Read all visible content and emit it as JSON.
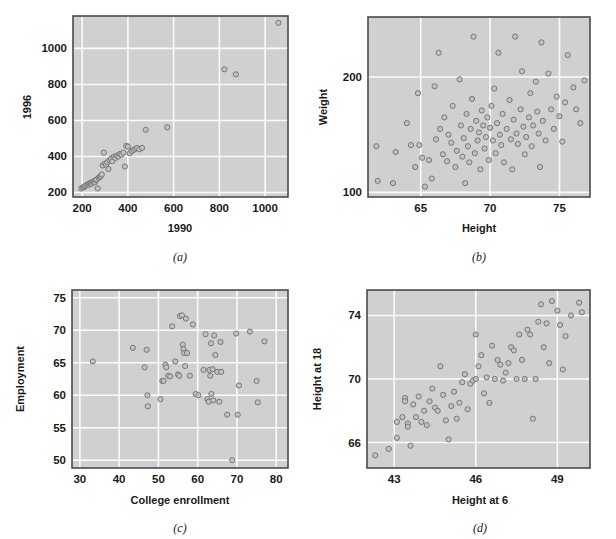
{
  "figure": {
    "background_color": "#ffffff",
    "panel_background_color": "#d0d0d0",
    "gridline_color": "#fbfbfb",
    "frame_color": "#4a4a4a",
    "marker_fill": "#c2c2c2",
    "marker_stroke": "#6e6e6e",
    "panel_count": 4
  },
  "captions": {
    "a": "(a)",
    "b": "(b)",
    "c": "(c)",
    "d": "(d)"
  },
  "chart_data": [
    {
      "id": "a",
      "type": "scatter",
      "title": "",
      "caption": "(a)",
      "xlabel": "1990",
      "ylabel": "1996",
      "xticks": [
        200,
        400,
        600,
        800,
        1000
      ],
      "yticks": [
        200,
        400,
        600,
        800,
        1000
      ],
      "xticklabels": [
        "200",
        "400",
        "600",
        "800",
        "1000"
      ],
      "yticklabels": [
        "200",
        "400",
        "600",
        "800",
        "1000"
      ],
      "xlim": [
        160,
        1100
      ],
      "ylim": [
        175,
        1180
      ],
      "grid": true,
      "legend": false,
      "points": [
        [
          196,
          222
        ],
        [
          203,
          228
        ],
        [
          209,
          231
        ],
        [
          213,
          236
        ],
        [
          218,
          240
        ],
        [
          224,
          245
        ],
        [
          229,
          243
        ],
        [
          233,
          251
        ],
        [
          238,
          254
        ],
        [
          241,
          249
        ],
        [
          246,
          258
        ],
        [
          250,
          262
        ],
        [
          255,
          256
        ],
        [
          259,
          268
        ],
        [
          263,
          272
        ],
        [
          268,
          223
        ],
        [
          272,
          281
        ],
        [
          277,
          287
        ],
        [
          281,
          292
        ],
        [
          286,
          300
        ],
        [
          290,
          350
        ],
        [
          295,
          421
        ],
        [
          300,
          360
        ],
        [
          305,
          355
        ],
        [
          310,
          368
        ],
        [
          315,
          330
        ],
        [
          320,
          378
        ],
        [
          326,
          388
        ],
        [
          332,
          374
        ],
        [
          338,
          398
        ],
        [
          345,
          392
        ],
        [
          352,
          405
        ],
        [
          358,
          400
        ],
        [
          365,
          414
        ],
        [
          372,
          410
        ],
        [
          380,
          422
        ],
        [
          387,
          344
        ],
        [
          393,
          460
        ],
        [
          400,
          455
        ],
        [
          408,
          418
        ],
        [
          416,
          430
        ],
        [
          424,
          436
        ],
        [
          432,
          442
        ],
        [
          440,
          447
        ],
        [
          450,
          440
        ],
        [
          462,
          448
        ],
        [
          478,
          548
        ],
        [
          572,
          562
        ],
        [
          822,
          884
        ],
        [
          872,
          856
        ],
        [
          1058,
          1142
        ]
      ]
    },
    {
      "id": "b",
      "type": "scatter",
      "title": "",
      "caption": "(b)",
      "xlabel": "Height",
      "ylabel": "Weight",
      "xticks": [
        65,
        70,
        75
      ],
      "yticks": [
        100,
        200
      ],
      "xticklabels": [
        "65",
        "70",
        "75"
      ],
      "yticklabels": [
        "100",
        "200"
      ],
      "xlim": [
        61.2,
        77.2
      ],
      "ylim": [
        96,
        252
      ],
      "grid": true,
      "legend": false,
      "points": [
        [
          61.8,
          140
        ],
        [
          61.9,
          110
        ],
        [
          63.0,
          108
        ],
        [
          63.2,
          135
        ],
        [
          64.0,
          160
        ],
        [
          64.3,
          141
        ],
        [
          64.6,
          122
        ],
        [
          64.8,
          186
        ],
        [
          64.9,
          141
        ],
        [
          65.1,
          130
        ],
        [
          65.3,
          105
        ],
        [
          65.6,
          128
        ],
        [
          65.8,
          112
        ],
        [
          66.0,
          192
        ],
        [
          66.1,
          146
        ],
        [
          66.3,
          221
        ],
        [
          66.4,
          155
        ],
        [
          66.6,
          133
        ],
        [
          66.7,
          165
        ],
        [
          66.9,
          127
        ],
        [
          67.0,
          150
        ],
        [
          67.2,
          143
        ],
        [
          67.3,
          175
        ],
        [
          67.5,
          122
        ],
        [
          67.6,
          136
        ],
        [
          67.8,
          198
        ],
        [
          67.9,
          158
        ],
        [
          68.0,
          131
        ],
        [
          68.1,
          147
        ],
        [
          68.2,
          108
        ],
        [
          68.3,
          168
        ],
        [
          68.4,
          140
        ],
        [
          68.5,
          126
        ],
        [
          68.6,
          155
        ],
        [
          68.7,
          181
        ],
        [
          68.8,
          235
        ],
        [
          68.9,
          134
        ],
        [
          69.0,
          162
        ],
        [
          69.1,
          145
        ],
        [
          69.2,
          152
        ],
        [
          69.3,
          120
        ],
        [
          69.4,
          171
        ],
        [
          69.5,
          158
        ],
        [
          69.6,
          138
        ],
        [
          69.7,
          148
        ],
        [
          69.8,
          165
        ],
        [
          69.9,
          128
        ],
        [
          70.0,
          156
        ],
        [
          70.1,
          175
        ],
        [
          70.2,
          145
        ],
        [
          70.3,
          190
        ],
        [
          70.4,
          134
        ],
        [
          70.5,
          160
        ],
        [
          70.6,
          221
        ],
        [
          70.7,
          150
        ],
        [
          70.8,
          141
        ],
        [
          70.9,
          168
        ],
        [
          71.0,
          126
        ],
        [
          71.2,
          155
        ],
        [
          71.4,
          180
        ],
        [
          71.5,
          146
        ],
        [
          71.6,
          120
        ],
        [
          71.7,
          163
        ],
        [
          71.8,
          235
        ],
        [
          71.9,
          151
        ],
        [
          72.0,
          142
        ],
        [
          72.2,
          172
        ],
        [
          72.3,
          205
        ],
        [
          72.4,
          157
        ],
        [
          72.5,
          133
        ],
        [
          72.6,
          148
        ],
        [
          72.8,
          165
        ],
        [
          72.9,
          186
        ],
        [
          73.0,
          140
        ],
        [
          73.1,
          158
        ],
        [
          73.3,
          196
        ],
        [
          73.4,
          170
        ],
        [
          73.5,
          151
        ],
        [
          73.6,
          122
        ],
        [
          73.7,
          230
        ],
        [
          73.8,
          162
        ],
        [
          74.0,
          145
        ],
        [
          74.2,
          203
        ],
        [
          74.4,
          172
        ],
        [
          74.6,
          155
        ],
        [
          74.8,
          183
        ],
        [
          75.0,
          166
        ],
        [
          75.2,
          144
        ],
        [
          75.4,
          178
        ],
        [
          75.6,
          219
        ],
        [
          76.0,
          191
        ],
        [
          76.2,
          172
        ],
        [
          76.5,
          160
        ],
        [
          76.8,
          197
        ]
      ]
    },
    {
      "id": "c",
      "type": "scatter",
      "title": "",
      "caption": "(c)",
      "xlabel": "College enrollment",
      "ylabel": "Employment",
      "xticks": [
        30,
        40,
        50,
        60,
        70,
        80
      ],
      "yticks": [
        50,
        55,
        60,
        65,
        70,
        75
      ],
      "xticklabels": [
        "30",
        "40",
        "50",
        "60",
        "70",
        "80"
      ],
      "yticklabels": [
        "50",
        "55",
        "60",
        "65",
        "70",
        "75"
      ],
      "xlim": [
        28,
        83
      ],
      "ylim": [
        48.8,
        76.2
      ],
      "grid": true,
      "legend": false,
      "points": [
        [
          33.3,
          65.2
        ],
        [
          43.5,
          67.3
        ],
        [
          46.5,
          64.3
        ],
        [
          47.0,
          67.0
        ],
        [
          47.2,
          60.0
        ],
        [
          47.3,
          58.3
        ],
        [
          50.5,
          59.4
        ],
        [
          51.0,
          62.2
        ],
        [
          51.3,
          62.2
        ],
        [
          51.8,
          64.7
        ],
        [
          52.0,
          64.3
        ],
        [
          52.5,
          63.0
        ],
        [
          53.0,
          62.9
        ],
        [
          53.5,
          70.6
        ],
        [
          54.3,
          65.2
        ],
        [
          55.0,
          63.2
        ],
        [
          55.3,
          63.0
        ],
        [
          55.5,
          72.2
        ],
        [
          56.0,
          72.3
        ],
        [
          56.2,
          67.8
        ],
        [
          56.4,
          67.1
        ],
        [
          56.6,
          66.5
        ],
        [
          56.8,
          64.5
        ],
        [
          57.0,
          71.8
        ],
        [
          57.3,
          66.5
        ],
        [
          58.0,
          63.0
        ],
        [
          58.8,
          70.9
        ],
        [
          59.5,
          60.2
        ],
        [
          60.2,
          60.0
        ],
        [
          61.5,
          63.9
        ],
        [
          62.0,
          69.4
        ],
        [
          62.5,
          59.4
        ],
        [
          62.8,
          59.0
        ],
        [
          63.0,
          63.9
        ],
        [
          63.2,
          63.0
        ],
        [
          63.4,
          68.0
        ],
        [
          63.5,
          60.2
        ],
        [
          63.8,
          64.0
        ],
        [
          64.0,
          59.2
        ],
        [
          64.2,
          69.2
        ],
        [
          64.5,
          66.2
        ],
        [
          65.0,
          63.6
        ],
        [
          65.5,
          59.0
        ],
        [
          65.8,
          68.2
        ],
        [
          66.0,
          63.6
        ],
        [
          67.5,
          57.0
        ],
        [
          68.8,
          50.0
        ],
        [
          69.8,
          69.5
        ],
        [
          70.2,
          57.0
        ],
        [
          70.5,
          61.5
        ],
        [
          73.3,
          69.8
        ],
        [
          75.0,
          62.2
        ],
        [
          75.3,
          58.9
        ],
        [
          77.0,
          68.3
        ]
      ]
    },
    {
      "id": "d",
      "type": "scatter",
      "title": "",
      "caption": "(d)",
      "xlabel": "Height at 6",
      "ylabel": "Height at 18",
      "ylabel_rendered": "Height at 18",
      "xticks": [
        43,
        46,
        49
      ],
      "yticks": [
        66,
        70,
        74
      ],
      "xticklabels": [
        "43",
        "46",
        "49"
      ],
      "yticklabels": [
        "66",
        "70",
        "74"
      ],
      "xlim": [
        42.0,
        50.2
      ],
      "ylim": [
        64.4,
        75.6
      ],
      "grid": true,
      "legend": false,
      "points": [
        [
          42.3,
          65.2
        ],
        [
          42.8,
          65.6
        ],
        [
          43.1,
          66.3
        ],
        [
          43.1,
          67.3
        ],
        [
          43.3,
          67.6
        ],
        [
          43.4,
          68.8
        ],
        [
          43.4,
          68.6
        ],
        [
          43.5,
          67.2
        ],
        [
          43.5,
          67.0
        ],
        [
          43.6,
          65.8
        ],
        [
          43.7,
          68.4
        ],
        [
          43.8,
          67.6
        ],
        [
          43.9,
          68.9
        ],
        [
          44.0,
          67.3
        ],
        [
          44.1,
          68.0
        ],
        [
          44.2,
          67.1
        ],
        [
          44.3,
          68.6
        ],
        [
          44.4,
          69.4
        ],
        [
          44.5,
          68.2
        ],
        [
          44.6,
          68.0
        ],
        [
          44.7,
          70.8
        ],
        [
          44.8,
          69.0
        ],
        [
          44.9,
          67.4
        ],
        [
          45.0,
          66.2
        ],
        [
          45.1,
          68.3
        ],
        [
          45.2,
          69.2
        ],
        [
          45.3,
          67.5
        ],
        [
          45.4,
          68.5
        ],
        [
          45.5,
          69.8
        ],
        [
          45.6,
          70.3
        ],
        [
          45.7,
          68.1
        ],
        [
          45.8,
          69.7
        ],
        [
          45.9,
          69.9
        ],
        [
          46.0,
          72.8
        ],
        [
          46.0,
          70.0
        ],
        [
          46.1,
          70.8
        ],
        [
          46.2,
          71.5
        ],
        [
          46.3,
          69.1
        ],
        [
          46.4,
          70.1
        ],
        [
          46.5,
          68.5
        ],
        [
          46.6,
          72.1
        ],
        [
          46.7,
          70.0
        ],
        [
          46.8,
          71.2
        ],
        [
          46.9,
          70.9
        ],
        [
          47.0,
          69.9
        ],
        [
          47.1,
          70.4
        ],
        [
          47.2,
          71.0
        ],
        [
          47.3,
          72.0
        ],
        [
          47.4,
          71.8
        ],
        [
          47.5,
          70.0
        ],
        [
          47.6,
          72.8
        ],
        [
          47.7,
          71.2
        ],
        [
          47.8,
          70.0
        ],
        [
          47.9,
          73.1
        ],
        [
          48.0,
          72.8
        ],
        [
          48.1,
          67.5
        ],
        [
          48.2,
          70.0
        ],
        [
          48.3,
          73.6
        ],
        [
          48.4,
          74.7
        ],
        [
          48.5,
          72.0
        ],
        [
          48.6,
          73.5
        ],
        [
          48.7,
          71.0
        ],
        [
          48.8,
          74.9
        ],
        [
          49.0,
          74.3
        ],
        [
          49.1,
          73.4
        ],
        [
          49.2,
          70.6
        ],
        [
          49.3,
          72.7
        ],
        [
          49.5,
          74.0
        ],
        [
          49.8,
          74.8
        ],
        [
          49.9,
          74.2
        ]
      ]
    }
  ]
}
